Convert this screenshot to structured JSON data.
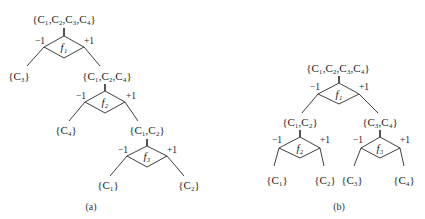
{
  "header_fragment": "",
  "tree_a": {
    "caption": "(a)",
    "nodes": {
      "n1": "{C₁,C₂,C₃,C₄}",
      "n2_left": "{C₃}",
      "n2_right": "{C₁,C₂,C₄}",
      "n3_left": "{C₄}",
      "n3_right": "{C₁,C₂}",
      "n4_left": "{C₁}",
      "n4_right": "{C₂}"
    },
    "classifiers": {
      "f1": "f₁",
      "f2": "f₂",
      "f3": "f₃"
    },
    "branch_labels": {
      "neg": "−1",
      "pos": "+1"
    }
  },
  "tree_b": {
    "caption": "(b)",
    "nodes": {
      "root": "{C₁,C₂,C₃,C₄}",
      "left": "{C₁,C₂}",
      "right": "{C₃,C₄}",
      "ll": "{C₁}",
      "lr": "{C₂}",
      "rl": "{C₃}",
      "rr": "{C₄}"
    },
    "classifiers": {
      "f1": "f₁",
      "f2": "f₂",
      "f3": "f₃"
    },
    "branch_labels": {
      "neg": "−1",
      "pos": "+1"
    }
  }
}
